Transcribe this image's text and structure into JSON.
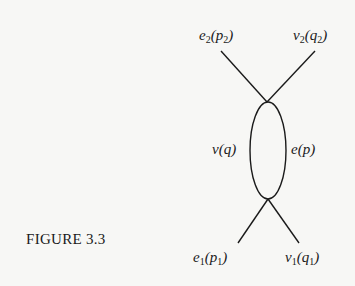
{
  "figure": {
    "caption": "FIGURE 3.3"
  },
  "labels": {
    "top_left": {
      "symbol": "e",
      "sub": "2",
      "arg": "p",
      "arg_sub": "2"
    },
    "top_right": {
      "symbol": "v",
      "sub": "2",
      "arg": "q",
      "arg_sub": "2"
    },
    "loop_left": {
      "text": "v(q)"
    },
    "loop_right": {
      "text": "e(p)"
    },
    "bottom_left": {
      "symbol": "e",
      "sub": "1",
      "arg": "p",
      "arg_sub": "1"
    },
    "bottom_right": {
      "symbol": "v",
      "sub": "1",
      "arg": "q",
      "arg_sub": "1"
    }
  },
  "colors": {
    "background": "#f7f7f5",
    "ink": "#1a1a1a"
  }
}
